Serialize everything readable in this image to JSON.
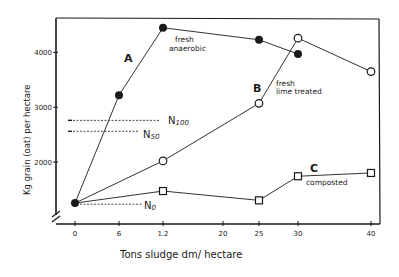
{
  "chart_data": {
    "type": "line",
    "title": "",
    "xlabel": "Tons sludge dm/ hectare",
    "ylabel": "Kg grain (oat) per hectare",
    "x_ticks": [
      0,
      6,
      12,
      20,
      25,
      30,
      40
    ],
    "x_tick_labels": [
      "0",
      "6",
      "1.2",
      "20",
      "25",
      "30",
      "40"
    ],
    "y_ticks": [
      2000,
      3000,
      4000
    ],
    "y_tick_labels": [
      "2000",
      "3000",
      "4000"
    ],
    "ylim": [
      800,
      4750
    ],
    "xlim": [
      0,
      41
    ],
    "grid": false,
    "axis_break": true,
    "series": [
      {
        "name": "A",
        "annotation": "fresh anaerobic",
        "marker": "filled-circle",
        "x": [
          0,
          6,
          12,
          25,
          30
        ],
        "values": [
          1250,
          3220,
          4450,
          4230,
          3970
        ]
      },
      {
        "name": "B",
        "annotation": "fresh lime treated",
        "marker": "open-circle",
        "x": [
          0,
          12,
          25,
          30,
          40
        ],
        "values": [
          1250,
          2020,
          3070,
          4260,
          3650
        ]
      },
      {
        "name": "C",
        "annotation": "composted",
        "marker": "open-square",
        "x": [
          0,
          12,
          25,
          30,
          40
        ],
        "values": [
          1250,
          1470,
          1300,
          1740,
          1800
        ]
      }
    ],
    "reference_lines": [
      {
        "label": "N",
        "sub": "100",
        "value": 2760
      },
      {
        "label": "N",
        "sub": "50",
        "value": 2560
      },
      {
        "label": "N",
        "sub": "0",
        "value": 1230
      }
    ]
  },
  "labels": {
    "x_axis_title": "Tons sludge dm/ hectare",
    "y_axis_title": "Kg grain (oat) per hectare",
    "series_a": "A",
    "series_a_note_1": "fresh",
    "series_a_note_2": "anaerobic",
    "series_b": "B",
    "series_b_note_1": "fresh",
    "series_b_note_2": "lime treated",
    "series_c": "C",
    "series_c_note": "composted",
    "n100_main": "N",
    "n100_sub": "100",
    "n50_main": "N",
    "n50_sub": "50",
    "n0_main": "N",
    "n0_sub": "0"
  }
}
